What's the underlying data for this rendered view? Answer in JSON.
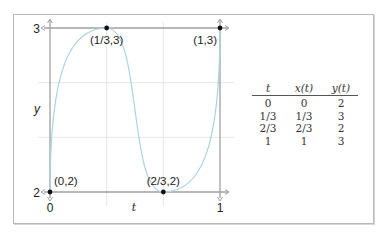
{
  "chart_data": {
    "type": "line",
    "title": "",
    "xlabel": "t",
    "ylabel": "y",
    "xlim": [
      0,
      1
    ],
    "ylim": [
      2,
      3
    ],
    "x_ticks": [
      {
        "value": 0,
        "label": "0"
      },
      {
        "value": 1,
        "label": "1"
      }
    ],
    "y_ticks": [
      {
        "value": 2,
        "label": "2"
      },
      {
        "value": 3,
        "label": "3"
      }
    ],
    "grid": {
      "x": [
        0.3333,
        0.6667
      ],
      "y": [
        2.3333,
        2.6667
      ]
    },
    "series": [
      {
        "name": "y(t)",
        "color": "#a9d3e0",
        "interpolation": "smooth, zero slope at interior knots",
        "points": [
          {
            "t": 0,
            "y": 2
          },
          {
            "t": 0.3333,
            "y": 3
          },
          {
            "t": 0.6667,
            "y": 2
          },
          {
            "t": 1,
            "y": 3
          }
        ]
      }
    ],
    "annotations": [
      {
        "t": 0,
        "y": 2,
        "label": "(0,2)",
        "position": "above-right"
      },
      {
        "t": 0.3333,
        "y": 3,
        "label": "(1/3,3)",
        "position": "below"
      },
      {
        "t": 0.6667,
        "y": 2,
        "label": "(2/3,2)",
        "position": "above"
      },
      {
        "t": 1,
        "y": 3,
        "label": "(1,3)",
        "position": "below-left"
      }
    ],
    "table": {
      "headers": [
        "t",
        "x(t)",
        "y(t)"
      ],
      "rows": [
        [
          "0",
          "0",
          "2"
        ],
        [
          "1/3",
          "1/3",
          "3"
        ],
        [
          "2/3",
          "2/3",
          "2"
        ],
        [
          "1",
          "1",
          "3"
        ]
      ]
    }
  },
  "colors": {
    "axis": "#a0a0a0",
    "grid": "#e6e6e6",
    "curve": "#a9d3e0",
    "point": "#111111",
    "text": "#222222"
  }
}
